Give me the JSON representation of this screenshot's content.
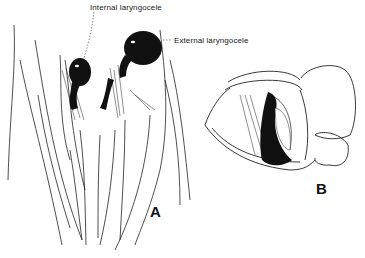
{
  "figure": {
    "labels": {
      "internal": "Internal laryngocele",
      "external": "External laryngocele"
    },
    "panels": {
      "a": "A",
      "b": "B"
    }
  }
}
